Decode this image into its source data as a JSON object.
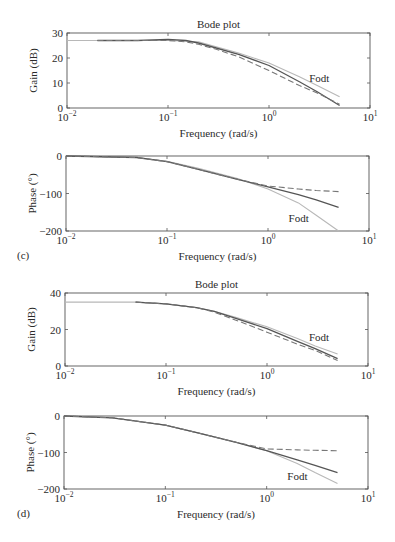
{
  "colors": {
    "background": "#ffffff",
    "axis": "#555555",
    "text": "#2a2a2a",
    "solid_series": "#555555",
    "dashed_series": "#777777",
    "fodt_series": "#b8b8b8"
  },
  "chart_data": [
    {
      "id": "c-gain",
      "type": "line",
      "panel": "",
      "title": "Bode plot",
      "xlabel": "Frequency (rad/s)",
      "ylabel": "Gain (dB)",
      "xscale": "log",
      "xlim": [
        0.01,
        10
      ],
      "ylim": [
        0,
        30
      ],
      "yticks": [
        0,
        10,
        20,
        30
      ],
      "xticks": [
        "10^-2",
        "10^-1",
        "10^0",
        "10^1"
      ],
      "annotation": {
        "text": "Fodt",
        "x": 2.5,
        "y": 12
      },
      "box": {
        "left": 67,
        "top": 33,
        "right": 370,
        "bottom": 108
      },
      "series": [
        {
          "name": "Fodt",
          "style": "light",
          "x": [
            0.01,
            0.05,
            0.1,
            0.2,
            0.3,
            0.5,
            1.0,
            2.0,
            3.0,
            5.0
          ],
          "y": [
            27,
            27,
            27,
            26.5,
            24.5,
            22,
            18,
            12.5,
            9,
            4.5
          ]
        },
        {
          "name": "solid",
          "style": "solid",
          "x": [
            0.02,
            0.05,
            0.1,
            0.15,
            0.2,
            0.3,
            0.5,
            1.0,
            2.0,
            3.0,
            5.0
          ],
          "y": [
            27,
            27,
            27.5,
            27,
            26,
            24,
            21.5,
            17,
            10.5,
            6.5,
            1
          ]
        },
        {
          "name": "dashed",
          "style": "dashed",
          "x": [
            0.02,
            0.05,
            0.1,
            0.15,
            0.2,
            0.3,
            0.5,
            1.0,
            2.0,
            3.0,
            5.0
          ],
          "y": [
            27,
            27,
            27,
            26.5,
            25.5,
            23.5,
            20.5,
            15,
            9,
            6,
            1.5
          ]
        }
      ]
    },
    {
      "id": "c-phase",
      "type": "line",
      "panel": "(c)",
      "title": "",
      "xlabel": "Frequency (rad/s)",
      "ylabel": "Phase (°)",
      "xscale": "log",
      "xlim": [
        0.01,
        10
      ],
      "ylim": [
        -200,
        0
      ],
      "yticks": [
        -200,
        -100,
        0
      ],
      "xticks": [
        "10^-2",
        "10^-1",
        "10^0",
        "10^1"
      ],
      "annotation": {
        "text": "Fodt",
        "x": 1.6,
        "y": -165
      },
      "box": {
        "left": 66,
        "top": 156,
        "right": 369,
        "bottom": 231
      },
      "series": [
        {
          "name": "Fodt",
          "style": "light",
          "x": [
            0.01,
            0.05,
            0.1,
            0.2,
            0.5,
            1.0,
            2.0,
            3.0,
            5.0
          ],
          "y": [
            0,
            -4,
            -14,
            -32,
            -60,
            -88,
            -125,
            -158,
            -200
          ]
        },
        {
          "name": "solid",
          "style": "solid",
          "x": [
            0.01,
            0.05,
            0.1,
            0.2,
            0.5,
            1.0,
            2.0,
            3.0,
            5.0
          ],
          "y": [
            0,
            -4,
            -15,
            -35,
            -62,
            -82,
            -103,
            -117,
            -137
          ]
        },
        {
          "name": "dashed",
          "style": "dashed",
          "x": [
            0.01,
            0.05,
            0.1,
            0.2,
            0.5,
            1.0,
            2.0,
            3.0,
            5.0
          ],
          "y": [
            0,
            -4,
            -15,
            -35,
            -62,
            -80,
            -88,
            -92,
            -95
          ]
        }
      ]
    },
    {
      "id": "d-gain",
      "type": "line",
      "panel": "",
      "title": "Bode plot",
      "xlabel": "Frequency (rad/s)",
      "ylabel": "Gain (dB)",
      "xscale": "log",
      "xlim": [
        0.01,
        10
      ],
      "ylim": [
        0,
        40
      ],
      "yticks": [
        0,
        20,
        40
      ],
      "xticks": [
        "10^-2",
        "10^-1",
        "10^0",
        "10^1"
      ],
      "annotation": {
        "text": "Fodt",
        "x": 2.6,
        "y": 16
      },
      "box": {
        "left": 65,
        "top": 293,
        "right": 368,
        "bottom": 366
      },
      "series": [
        {
          "name": "Fodt",
          "style": "light",
          "x": [
            0.01,
            0.05,
            0.1,
            0.2,
            0.3,
            0.5,
            1.0,
            2.0,
            3.0,
            5.0
          ],
          "y": [
            35,
            35,
            34,
            32,
            30,
            26.5,
            21.5,
            15,
            11,
            6.5
          ]
        },
        {
          "name": "solid",
          "style": "solid",
          "x": [
            0.05,
            0.1,
            0.2,
            0.3,
            0.5,
            1.0,
            2.0,
            3.0,
            5.0
          ],
          "y": [
            35,
            34,
            32,
            30,
            26,
            20.5,
            13.5,
            9.5,
            4
          ]
        },
        {
          "name": "dashed",
          "style": "dashed",
          "x": [
            0.05,
            0.1,
            0.2,
            0.3,
            0.5,
            1.0,
            2.0,
            3.0,
            5.0
          ],
          "y": [
            35,
            34,
            32,
            29.5,
            25,
            18.5,
            12,
            8.5,
            3
          ]
        }
      ]
    },
    {
      "id": "d-phase",
      "type": "line",
      "panel": "(d)",
      "title": "",
      "xlabel": "Frequency (rad/s)",
      "ylabel": "Phase (°)",
      "xscale": "log",
      "xlim": [
        0.01,
        10
      ],
      "ylim": [
        -200,
        0
      ],
      "yticks": [
        -200,
        -100,
        0
      ],
      "xticks": [
        "10^-2",
        "10^-1",
        "10^0",
        "10^1"
      ],
      "annotation": {
        "text": "Fodt",
        "x": 1.6,
        "y": -165
      },
      "box": {
        "left": 64,
        "top": 416,
        "right": 368,
        "bottom": 489
      },
      "series": [
        {
          "name": "Fodt",
          "style": "light",
          "x": [
            0.01,
            0.03,
            0.1,
            0.2,
            0.5,
            1.0,
            2.0,
            3.0,
            5.0
          ],
          "y": [
            0,
            -5,
            -25,
            -45,
            -72,
            -95,
            -130,
            -155,
            -185
          ]
        },
        {
          "name": "solid",
          "style": "solid",
          "x": [
            0.01,
            0.03,
            0.1,
            0.2,
            0.5,
            1.0,
            2.0,
            3.0,
            5.0
          ],
          "y": [
            0,
            -5,
            -25,
            -45,
            -72,
            -95,
            -120,
            -135,
            -155
          ]
        },
        {
          "name": "dashed",
          "style": "dashed",
          "x": [
            0.01,
            0.03,
            0.1,
            0.2,
            0.5,
            1.0,
            2.0,
            3.0,
            5.0
          ],
          "y": [
            0,
            -5,
            -25,
            -45,
            -72,
            -90,
            -93,
            -94,
            -95
          ]
        }
      ]
    }
  ]
}
